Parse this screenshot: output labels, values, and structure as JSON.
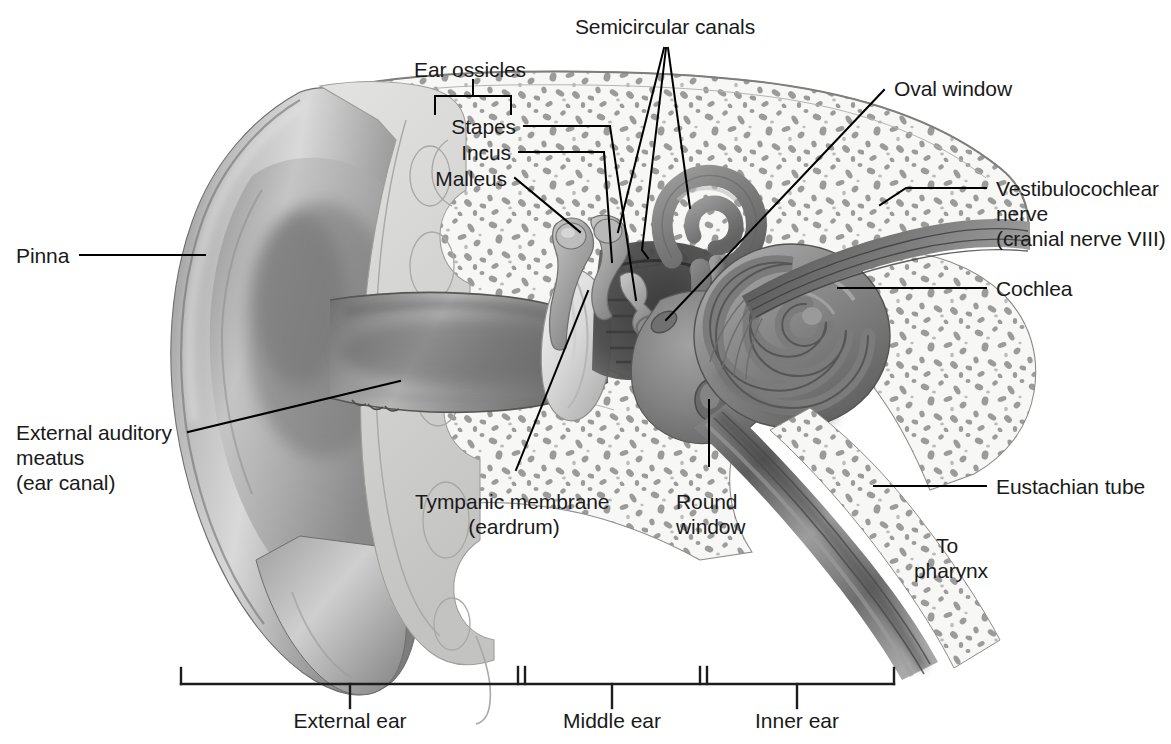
{
  "figure": {
    "type": "labeled anatomical cross-section illustration",
    "style": "grayscale medical illustration",
    "background_color": "#ffffff",
    "text_color": "#1a1a1a",
    "line_color": "#000000"
  },
  "labels": {
    "semicircular_canals": "Semicircular canals",
    "ear_ossicles": "Ear ossicles",
    "stapes": "Stapes",
    "incus": "Incus",
    "malleus": "Malleus",
    "oval_window": "Oval window",
    "vestibulocochlear_nerve_line1": "Vestibulocochlear",
    "vestibulocochlear_nerve_line2": "nerve",
    "vestibulocochlear_nerve_line3": "(cranial nerve VIII)",
    "cochlea": "Cochlea",
    "pinna": "Pinna",
    "external_auditory_line1": "External auditory",
    "external_auditory_line2": "meatus",
    "external_auditory_line3": "(ear canal)",
    "tympanic_membrane_line1": "Tympanic membrane",
    "tympanic_membrane_line2": "(eardrum)",
    "round_window_line1": "Round",
    "round_window_line2": "window",
    "eustachian_tube": "Eustachian tube",
    "to_pharynx_line1": "To",
    "to_pharynx_line2": "pharynx"
  },
  "scale_bar": {
    "regions": [
      {
        "name": "external-ear",
        "label": "External ear"
      },
      {
        "name": "middle-ear",
        "label": "Middle ear"
      },
      {
        "name": "inner-ear",
        "label": "Inner ear"
      }
    ]
  },
  "anatomy_parts": [
    "pinna",
    "external-auditory-meatus",
    "tympanic-membrane",
    "malleus",
    "incus",
    "stapes",
    "semicircular-canals",
    "oval-window",
    "round-window",
    "cochlea",
    "vestibulocochlear-nerve",
    "eustachian-tube",
    "temporal-bone"
  ]
}
